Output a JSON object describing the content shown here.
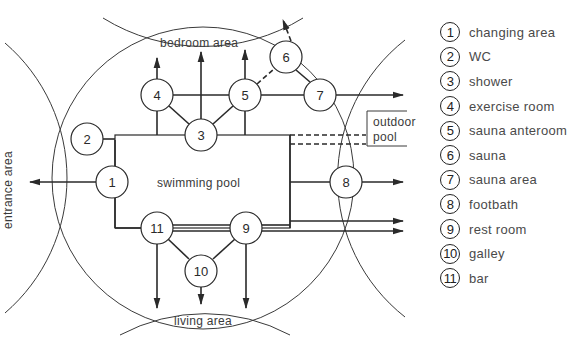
{
  "diagram": {
    "areas": {
      "bedroom": "bedroom area",
      "living": "living area",
      "entrance": "entrance area",
      "outdoor_pool_line1": "outdoor",
      "outdoor_pool_line2": "pool",
      "pool": "swimming pool"
    },
    "nodes": [
      {
        "id": "1",
        "label": "1",
        "x": 112,
        "y": 182
      },
      {
        "id": "2",
        "label": "2",
        "x": 87,
        "y": 139
      },
      {
        "id": "3",
        "label": "3",
        "x": 201,
        "y": 135
      },
      {
        "id": "4",
        "label": "4",
        "x": 157,
        "y": 95
      },
      {
        "id": "5",
        "label": "5",
        "x": 245,
        "y": 95
      },
      {
        "id": "6",
        "label": "6",
        "x": 286,
        "y": 57
      },
      {
        "id": "7",
        "label": "7",
        "x": 320,
        "y": 95
      },
      {
        "id": "8",
        "label": "8",
        "x": 346,
        "y": 182
      },
      {
        "id": "9",
        "label": "9",
        "x": 246,
        "y": 228
      },
      {
        "id": "10",
        "label": "10",
        "x": 201,
        "y": 271
      },
      {
        "id": "11",
        "label": "11",
        "x": 157,
        "y": 228
      }
    ]
  },
  "legend": {
    "items": [
      {
        "num": "1",
        "label": "changing area"
      },
      {
        "num": "2",
        "label": "WC"
      },
      {
        "num": "3",
        "label": "shower"
      },
      {
        "num": "4",
        "label": "exercise room"
      },
      {
        "num": "5",
        "label": "sauna anteroom"
      },
      {
        "num": "6",
        "label": "sauna"
      },
      {
        "num": "7",
        "label": "sauna area"
      },
      {
        "num": "8",
        "label": "footbath"
      },
      {
        "num": "9",
        "label": "rest room"
      },
      {
        "num": "10",
        "label": "galley"
      },
      {
        "num": "11",
        "label": "bar"
      }
    ]
  }
}
